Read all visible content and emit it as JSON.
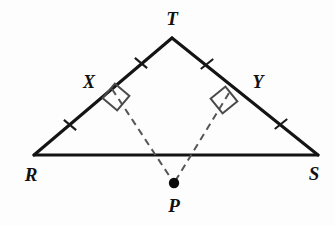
{
  "figure": {
    "background_color": "#fdfdfd",
    "line_color": "#141414",
    "dash_color": "#555555",
    "label_color": "#111111",
    "width": 335,
    "height": 225
  },
  "labels": {
    "apex": "T",
    "left_base": "R",
    "right_base": "S",
    "left_foot": "X",
    "right_foot": "Y",
    "point": "P"
  },
  "geometry": {
    "points": {
      "T": {
        "x": 172,
        "y": 38
      },
      "R": {
        "x": 34,
        "y": 155
      },
      "S": {
        "x": 318,
        "y": 155
      },
      "X": {
        "x": 112,
        "y": 89
      },
      "Y": {
        "x": 229,
        "y": 93
      },
      "P": {
        "x": 174,
        "y": 183
      }
    },
    "label_positions": {
      "T": {
        "x": 172,
        "y": 25
      },
      "R": {
        "x": 31,
        "y": 181
      },
      "S": {
        "x": 314,
        "y": 180
      },
      "X": {
        "x": 89,
        "y": 88
      },
      "Y": {
        "x": 258,
        "y": 88
      },
      "P": {
        "x": 174,
        "y": 212
      }
    },
    "segments": [
      {
        "name": "RT",
        "from": "R",
        "to": "T",
        "style": "solid"
      },
      {
        "name": "TS",
        "from": "T",
        "to": "S",
        "style": "solid"
      },
      {
        "name": "RS",
        "from": "R",
        "to": "S",
        "style": "solid"
      },
      {
        "name": "XP",
        "from": "X",
        "to": "P",
        "style": "dashed"
      },
      {
        "name": "YP",
        "from": "Y",
        "to": "P",
        "style": "dashed"
      }
    ],
    "tick_marks": [
      {
        "name": "tick-TX",
        "segment": "TX",
        "cx": 141,
        "cy": 63,
        "angle": 40
      },
      {
        "name": "tick-XR",
        "segment": "XR",
        "cx": 70,
        "cy": 125,
        "angle": 40
      },
      {
        "name": "tick-TY",
        "segment": "TY",
        "cx": 207,
        "cy": 64,
        "angle": -39
      },
      {
        "name": "tick-YS",
        "segment": "YS",
        "cx": 281,
        "cy": 124,
        "angle": -39
      }
    ],
    "right_angles": [
      {
        "name": "right-angle-X",
        "at": "X",
        "cx": 116,
        "cy": 97,
        "size": 19,
        "angle": 40
      },
      {
        "name": "right-angle-Y",
        "at": "Y",
        "cx": 224,
        "cy": 100,
        "size": 19,
        "angle": -39
      }
    ],
    "point_marker": {
      "name": "point-P-dot",
      "cx": 174,
      "cy": 183,
      "r": 5.2
    }
  }
}
